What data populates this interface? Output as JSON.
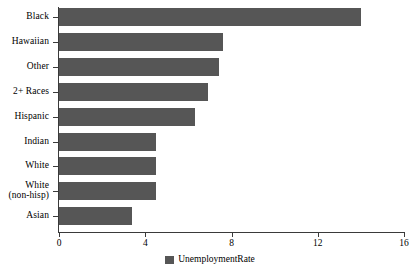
{
  "chart_data": {
    "type": "bar",
    "orientation": "horizontal",
    "title": "",
    "xlabel": "",
    "ylabel": "",
    "xlim": [
      0,
      16
    ],
    "xticks": [
      0,
      4,
      8,
      12,
      16
    ],
    "xtick_labels": [
      "0",
      "4",
      "8",
      "12",
      "16"
    ],
    "grid": false,
    "legend_position": "bottom-center",
    "categories": [
      "Black",
      "Hawaiian",
      "Other",
      "2+ Races",
      "Hispanic",
      "Indian",
      "White",
      "White\n(non-hisp)",
      "Asian"
    ],
    "series": [
      {
        "name": "UnemploymentRate",
        "color": "#565656",
        "values": [
          14.0,
          7.6,
          7.4,
          6.9,
          6.3,
          4.5,
          4.5,
          4.5,
          3.4
        ]
      }
    ]
  },
  "legend": {
    "entries": [
      {
        "label": "UnemploymentRate",
        "color": "#565656"
      }
    ]
  },
  "style": {
    "background": "#ffffff",
    "axis_color": "#3a3a3a",
    "bar_color": "#565656",
    "text_color": "#000000"
  }
}
